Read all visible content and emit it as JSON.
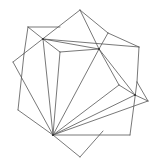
{
  "diagram": {
    "width": 160,
    "height": 166,
    "stroke_color": "#555555",
    "hub_color": "#333333",
    "points": {
      "top": [
        80,
        10
      ],
      "bracket_tl": [
        28,
        27
      ],
      "hub_ul": [
        43,
        39
      ],
      "inner_corner": [
        60,
        52
      ],
      "hub_r": [
        99,
        49
      ],
      "upper_r": [
        108,
        33
      ],
      "corner_r": [
        139,
        47
      ],
      "corner_l": [
        13,
        62
      ],
      "lower_l": [
        18,
        110
      ],
      "hub_b": [
        53,
        135
      ],
      "bottom": [
        80,
        157
      ],
      "corner_br": [
        130,
        135
      ],
      "mid_r": [
        135,
        95
      ],
      "far_r": [
        148,
        101
      ],
      "inner_r": [
        119,
        85
      ],
      "side_r": [
        137,
        82
      ],
      "left_side": [
        24,
        54
      ]
    },
    "edges": [
      [
        "top",
        "corner_l"
      ],
      [
        "top",
        "hub_r"
      ],
      [
        "top",
        "upper_r"
      ],
      [
        "upper_r",
        "corner_r"
      ],
      [
        "upper_r",
        "hub_r"
      ],
      [
        "corner_r",
        "side_r"
      ],
      [
        "bracket_tl",
        "hub_ul"
      ],
      [
        "bracket_tl",
        "left_side"
      ],
      [
        "bracket_tl",
        "upper_bracket_end"
      ],
      [
        "hub_ul",
        "inner_corner"
      ],
      [
        "hub_ul",
        "hub_r"
      ],
      [
        "hub_ul",
        "corner_r"
      ],
      [
        "hub_ul",
        "hub_b"
      ],
      [
        "inner_corner",
        "hub_r"
      ],
      [
        "inner_corner",
        "hub_b"
      ],
      [
        "hub_r",
        "hub_b"
      ],
      [
        "hub_r",
        "inner_r"
      ],
      [
        "hub_r",
        "mid_r"
      ],
      [
        "inner_r",
        "mid_r"
      ],
      [
        "inner_r",
        "hub_b"
      ],
      [
        "mid_r",
        "far_r"
      ],
      [
        "mid_r",
        "hub_b"
      ],
      [
        "side_r",
        "far_r"
      ],
      [
        "side_r",
        "corner_br"
      ],
      [
        "far_r",
        "hub_b"
      ],
      [
        "corner_br",
        "hub_b"
      ],
      [
        "corner_l",
        "hub_b"
      ],
      [
        "left_side",
        "lower_l"
      ],
      [
        "lower_l",
        "hub_b"
      ],
      [
        "hub_b",
        "bottom"
      ],
      [
        "bottom",
        "inner_r_low"
      ]
    ]
  }
}
